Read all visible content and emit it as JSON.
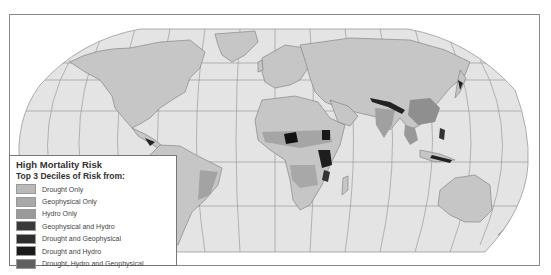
{
  "map": {
    "title": "High Mortality Risk",
    "subtitle": "Top 3 Deciles of Risk from:",
    "projection": "Robinson",
    "colors": {
      "ocean": "#e6e6e6",
      "land": "#c8c8c8",
      "graticule": "#8c8c8c",
      "border": "#777777"
    }
  },
  "legend": {
    "title": "High Mortality Risk",
    "subtitle": "Top 3 Deciles of Risk from:",
    "items": [
      {
        "label": "Drought Only",
        "color": "#b9b9b9"
      },
      {
        "label": "Geophysical Only",
        "color": "#a8a8a8"
      },
      {
        "label": "Hydro Only",
        "color": "#9a9a9a"
      },
      {
        "label": "Geophysical and Hydro",
        "color": "#3a3a3a"
      },
      {
        "label": "Drought and Geophysical",
        "color": "#2e2e2e"
      },
      {
        "label": "Drought and Hydro",
        "color": "#1a1a1a"
      },
      {
        "label": "Drought, Hydro and Geophysical",
        "color": "#606060"
      }
    ]
  }
}
